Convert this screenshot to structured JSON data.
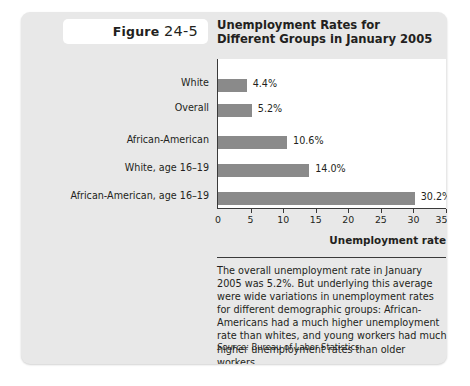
{
  "figure": {
    "badge_label": "Figure",
    "badge_number": "24-5",
    "title_line1": "Unemployment Rates for",
    "title_line2": "Different Groups in January 2005"
  },
  "chart_data": {
    "type": "bar",
    "orientation": "horizontal",
    "title": "Unemployment Rates for Different Groups in January 2005",
    "categories": [
      "White",
      "Overall",
      "African-American",
      "White, age 16–19",
      "African-American, age 16–19"
    ],
    "values": [
      4.4,
      5.2,
      10.6,
      14.0,
      30.2
    ],
    "value_labels": [
      "4.4%",
      "5.2%",
      "10.6%",
      "14.0%",
      "30.2%"
    ],
    "xlabel": "Unemployment rate",
    "ylabel": "",
    "xlim": [
      0,
      35
    ],
    "xticks": [
      0,
      5,
      10,
      15,
      20,
      25,
      30,
      35
    ],
    "xtick_labels": [
      "0",
      "5",
      "10",
      "15",
      "20",
      "25",
      "30",
      "35%"
    ],
    "grid": false,
    "legend": false,
    "bar_color": "#8a8a8a",
    "axis_color": "#3a3a3a",
    "plot_background": "#ffffff",
    "card_background": "#e8e8e8"
  },
  "caption": {
    "body": "The overall unemployment rate in January 2005 was 5.2%. But underlying this average were wide variations in unemployment rates for different demographic groups: African-Americans had a much higher unemployment rate than whites, and young workers had much higher unemployment rates than older workers.",
    "source_label": "Source:",
    "source_value": "Bureau of Labor Statistics."
  }
}
